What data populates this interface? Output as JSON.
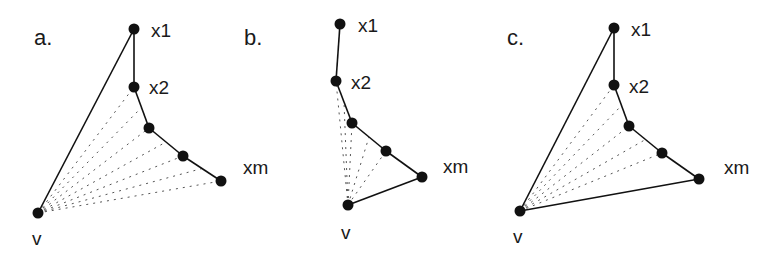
{
  "figure": {
    "panels": [
      {
        "id": "a",
        "label": "a.",
        "label_pos": [
          34,
          45
        ],
        "nodes": [
          {
            "name": "x1",
            "label": "x1",
            "x": 134,
            "y": 29,
            "lx": 151,
            "ly": 37
          },
          {
            "name": "x2",
            "label": "x2",
            "x": 134,
            "y": 87,
            "lx": 149,
            "ly": 94
          },
          {
            "name": "p3",
            "label": "",
            "x": 149,
            "y": 128
          },
          {
            "name": "p4",
            "label": "",
            "x": 183,
            "y": 156
          },
          {
            "name": "xm",
            "label": "xm",
            "x": 221,
            "y": 181,
            "lx": 243,
            "ly": 174
          },
          {
            "name": "v",
            "label": "v",
            "x": 38,
            "y": 213,
            "lx": 32,
            "ly": 245
          }
        ],
        "solid_edges": [
          [
            "x1",
            "x2"
          ],
          [
            "x2",
            "p3"
          ],
          [
            "p3",
            "p4"
          ],
          [
            "p4",
            "xm"
          ],
          [
            "v",
            "x1"
          ]
        ],
        "dotted_edges": [
          [
            "v",
            "x2"
          ],
          [
            "v",
            "p3"
          ],
          [
            "v",
            "p4"
          ],
          [
            "v",
            "xm"
          ]
        ]
      },
      {
        "id": "b",
        "label": "b.",
        "label_pos": [
          244,
          45
        ],
        "nodes": [
          {
            "name": "x1",
            "label": "x1",
            "x": 340,
            "y": 24,
            "lx": 358,
            "ly": 32
          },
          {
            "name": "x2",
            "label": "x2",
            "x": 336,
            "y": 81,
            "lx": 351,
            "ly": 89
          },
          {
            "name": "p3",
            "label": "",
            "x": 352,
            "y": 123
          },
          {
            "name": "p4",
            "label": "",
            "x": 386,
            "y": 151
          },
          {
            "name": "xm",
            "label": "xm",
            "x": 422,
            "y": 177,
            "lx": 443,
            "ly": 173
          },
          {
            "name": "v",
            "label": "v",
            "x": 348,
            "y": 205,
            "lx": 341,
            "ly": 239
          }
        ],
        "solid_edges": [
          [
            "x1",
            "x2"
          ],
          [
            "x2",
            "p3"
          ],
          [
            "p3",
            "p4"
          ],
          [
            "p4",
            "xm"
          ],
          [
            "xm",
            "v"
          ]
        ],
        "dotted_edges": [
          [
            "v",
            "x2"
          ],
          [
            "v",
            "p3"
          ],
          [
            "v",
            "p4"
          ]
        ]
      },
      {
        "id": "c",
        "label": "c.",
        "label_pos": [
          507,
          45
        ],
        "nodes": [
          {
            "name": "x1",
            "label": "x1",
            "x": 614,
            "y": 28,
            "lx": 631,
            "ly": 36
          },
          {
            "name": "x2",
            "label": "x2",
            "x": 614,
            "y": 85,
            "lx": 629,
            "ly": 93
          },
          {
            "name": "p3",
            "label": "",
            "x": 629,
            "y": 126
          },
          {
            "name": "p4",
            "label": "",
            "x": 662,
            "y": 153
          },
          {
            "name": "xm",
            "label": "xm",
            "x": 699,
            "y": 179,
            "lx": 724,
            "ly": 174
          },
          {
            "name": "v",
            "label": "v",
            "x": 520,
            "y": 211,
            "lx": 513,
            "ly": 243
          }
        ],
        "solid_edges": [
          [
            "x1",
            "x2"
          ],
          [
            "x2",
            "p3"
          ],
          [
            "p3",
            "p4"
          ],
          [
            "p4",
            "xm"
          ],
          [
            "v",
            "x1"
          ],
          [
            "v",
            "xm"
          ]
        ],
        "dotted_edges": [
          [
            "v",
            "x2"
          ],
          [
            "v",
            "p3"
          ],
          [
            "v",
            "p4"
          ]
        ]
      }
    ]
  }
}
